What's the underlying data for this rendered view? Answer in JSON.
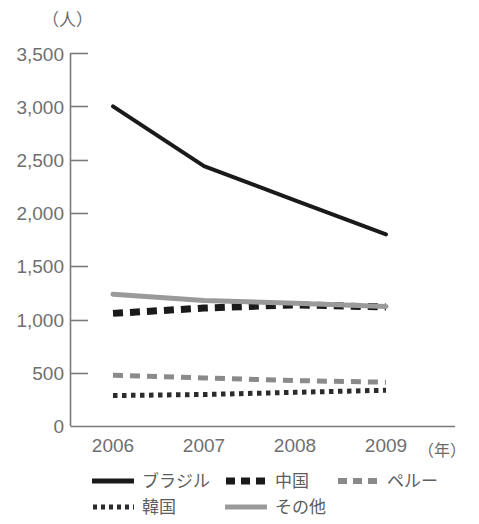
{
  "chart_data": {
    "type": "line",
    "title": "",
    "subtitle": "",
    "ylabel": "（人）",
    "xlabel": "（年）",
    "categories": [
      "2006",
      "2007",
      "2008",
      "2009"
    ],
    "x": [
      2006,
      2007,
      2008,
      2009
    ],
    "ylim": [
      0,
      3500
    ],
    "yticks": [
      0,
      500,
      1000,
      1500,
      2000,
      2500,
      3000,
      3500
    ],
    "ytick_labels": [
      "0",
      "500",
      "1,000",
      "1,500",
      "2,000",
      "2,500",
      "3,000",
      "3,500"
    ],
    "grid": false,
    "legend_position": "bottom",
    "series": [
      {
        "name": "ブラジル",
        "values": [
          3000,
          2440,
          2120,
          1800
        ],
        "color": "#1a1a1a",
        "style": "solid",
        "width": 4
      },
      {
        "name": "中国",
        "values": [
          1060,
          1110,
          1140,
          1120
        ],
        "color": "#1a1a1a",
        "style": "dashed-thick",
        "width": 7
      },
      {
        "name": "ペルー",
        "values": [
          480,
          455,
          430,
          415
        ],
        "color": "#8a8a8a",
        "style": "dashed-thin",
        "width": 5
      },
      {
        "name": "韓国",
        "values": [
          290,
          300,
          320,
          340
        ],
        "color": "#2b2b2b",
        "style": "dotted",
        "width": 5
      },
      {
        "name": "その他",
        "values": [
          1240,
          1180,
          1155,
          1125
        ],
        "color": "#9a9a9a",
        "style": "solid",
        "width": 5
      }
    ]
  },
  "axis": {
    "unit_top": "（人）",
    "unit_right": "（年）",
    "y_labels": [
      "3,500",
      "3,000",
      "2,500",
      "2,000",
      "1,500",
      "1,000",
      "500",
      "0"
    ],
    "x_labels": [
      "2006",
      "2007",
      "2008",
      "2009"
    ]
  },
  "legend": {
    "rows": [
      [
        {
          "label": "ブラジル",
          "style": "solid",
          "color": "#1a1a1a"
        },
        {
          "label": "中国",
          "style": "dashed-thick",
          "color": "#1a1a1a"
        },
        {
          "label": "ペルー",
          "style": "dashed-thin",
          "color": "#8a8a8a"
        }
      ],
      [
        {
          "label": "韓国",
          "style": "dotted",
          "color": "#2b2b2b"
        },
        {
          "label": "その他",
          "style": "solid",
          "color": "#9a9a9a"
        }
      ]
    ]
  }
}
